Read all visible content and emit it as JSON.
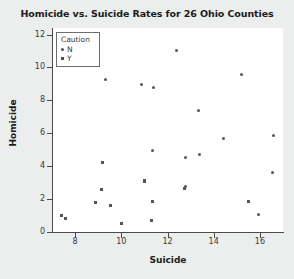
{
  "chart_data": {
    "type": "scatter",
    "title": "Homicide vs. Suicide Rates for 26 Ohio Counties",
    "xlabel": "Suicide",
    "ylabel": "Homicide",
    "xlim": [
      7.0,
      17.0
    ],
    "ylim": [
      0,
      12.4
    ],
    "xticks": [
      8,
      10,
      12,
      14,
      16
    ],
    "yticks": [
      0,
      2,
      4,
      6,
      8,
      10,
      12
    ],
    "grid": false,
    "legend": {
      "title": "Caution",
      "position": "upper-left-inside",
      "entries": [
        {
          "label": "N",
          "marker": "circle"
        },
        {
          "label": "Y",
          "marker": "square"
        }
      ]
    },
    "series": [
      {
        "name": "N",
        "marker": "circle",
        "points": [
          {
            "x": 9.3,
            "y": 9.25
          },
          {
            "x": 10.9,
            "y": 8.95
          },
          {
            "x": 11.4,
            "y": 8.8
          },
          {
            "x": 12.4,
            "y": 11.0
          },
          {
            "x": 15.2,
            "y": 9.55
          },
          {
            "x": 13.35,
            "y": 7.4
          },
          {
            "x": 14.45,
            "y": 5.65
          },
          {
            "x": 16.6,
            "y": 5.85
          },
          {
            "x": 11.35,
            "y": 4.95
          },
          {
            "x": 12.8,
            "y": 4.55
          },
          {
            "x": 13.4,
            "y": 4.7
          },
          {
            "x": 16.55,
            "y": 3.6
          },
          {
            "x": 12.8,
            "y": 2.75
          },
          {
            "x": 15.95,
            "y": 1.05
          }
        ]
      },
      {
        "name": "Y",
        "marker": "square",
        "points": [
          {
            "x": 9.2,
            "y": 4.2
          },
          {
            "x": 11.0,
            "y": 3.1
          },
          {
            "x": 9.15,
            "y": 2.6
          },
          {
            "x": 8.9,
            "y": 1.8
          },
          {
            "x": 9.55,
            "y": 1.6
          },
          {
            "x": 11.35,
            "y": 1.85
          },
          {
            "x": 15.5,
            "y": 1.85
          },
          {
            "x": 7.4,
            "y": 1.0
          },
          {
            "x": 7.6,
            "y": 0.8
          },
          {
            "x": 10.0,
            "y": 0.5
          },
          {
            "x": 11.3,
            "y": 0.7
          },
          {
            "x": 12.75,
            "y": 2.65
          }
        ]
      }
    ]
  }
}
